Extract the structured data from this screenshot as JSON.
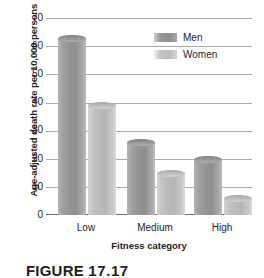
{
  "chart_data": {
    "type": "bar",
    "title": "",
    "subtitle": "",
    "xlabel": "Fitness category",
    "ylabel": "Age-adjusted death rate per 10,000 persons",
    "categories": [
      "Low",
      "Medium",
      "High"
    ],
    "series": [
      {
        "name": "Men",
        "color": "#949494",
        "values": [
          63,
          26,
          20
        ]
      },
      {
        "name": "Women",
        "color": "#bdbdbd",
        "values": [
          39,
          15,
          6
        ]
      }
    ],
    "ylim": [
      0,
      70
    ],
    "ytick_labels": [
      "0",
      "10",
      "20",
      "30",
      "40",
      "50",
      "60",
      "70"
    ],
    "ytick_values": [
      0,
      10,
      20,
      30,
      40,
      50,
      60,
      70
    ],
    "grid": "horizontal",
    "legend_position": "top-right",
    "legend_entries": [
      "Men",
      "Women"
    ],
    "annotations": []
  },
  "caption": {
    "figure_label": "FIGURE",
    "figure_number": "17.17"
  }
}
